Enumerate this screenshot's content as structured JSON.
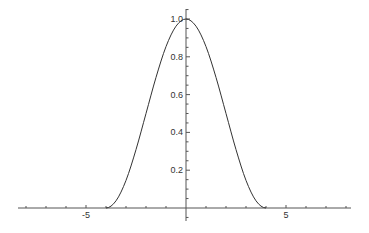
{
  "chart_data": {
    "type": "line",
    "title": "",
    "xlabel": "",
    "ylabel": "",
    "xlim": [
      -8.4,
      8.25
    ],
    "ylim": [
      -0.06,
      1.05
    ],
    "grid": false,
    "legend": null,
    "function_description": "f(x) = cos^2(pi x / 8) for |x| <= 4, 0 otherwise",
    "x_ticks": [
      {
        "value": -5,
        "label": "-5"
      },
      {
        "value": 5,
        "label": "5"
      }
    ],
    "x_minor_ticks": [
      -8,
      -7,
      -6,
      -5,
      -4,
      -3,
      -2,
      -1,
      1,
      2,
      3,
      4,
      5,
      6,
      7,
      8
    ],
    "y_ticks": [
      {
        "value": 0.2,
        "label": "0.2"
      },
      {
        "value": 0.4,
        "label": "0.4"
      },
      {
        "value": 0.6,
        "label": "0.6"
      },
      {
        "value": 0.8,
        "label": "0.8"
      },
      {
        "value": 1.0,
        "label": "1.0"
      }
    ],
    "series": [
      {
        "name": "curve",
        "color": "#333333",
        "x": [
          -8,
          -4,
          -3.5,
          -3,
          -2.5,
          -2,
          -1.5,
          -1,
          -0.5,
          0,
          0.5,
          1,
          1.5,
          2,
          2.5,
          3,
          3.5,
          4,
          8
        ],
        "values": [
          0,
          0,
          0.038,
          0.146,
          0.309,
          0.5,
          0.691,
          0.854,
          0.962,
          1.0,
          0.962,
          0.854,
          0.691,
          0.5,
          0.309,
          0.146,
          0.038,
          0,
          0
        ]
      }
    ]
  },
  "style": {
    "axis_color": "#555555",
    "curve_color": "#333333",
    "label_color": "#333333"
  }
}
